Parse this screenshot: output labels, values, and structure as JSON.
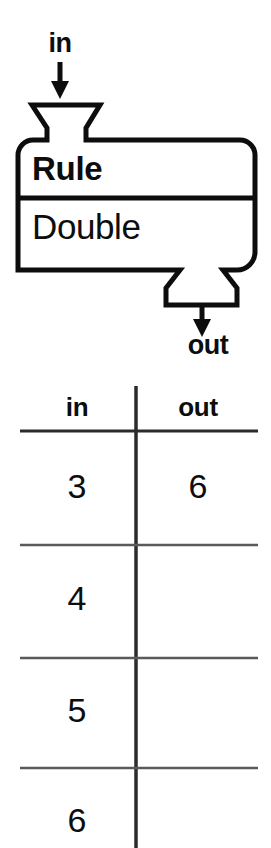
{
  "diagram": {
    "type": "function-machine",
    "input_label": "in",
    "output_label": "out",
    "machine": {
      "header_label": "Rule",
      "rule_label": "Double"
    }
  },
  "table": {
    "headers": [
      "in",
      "out"
    ],
    "rows": [
      {
        "in": "3",
        "out": "6"
      },
      {
        "in": "4",
        "out": ""
      },
      {
        "in": "5",
        "out": ""
      },
      {
        "in": "6",
        "out": ""
      }
    ]
  },
  "icons": {
    "input_arrow": "arrow-down-icon",
    "output_arrow": "arrow-down-icon",
    "hopper": "funnel-icon",
    "spout": "funnel-icon"
  },
  "colors": {
    "ink": "#0d0d0d",
    "background": "#ffffff",
    "rule_line": "#3a3a3a"
  }
}
